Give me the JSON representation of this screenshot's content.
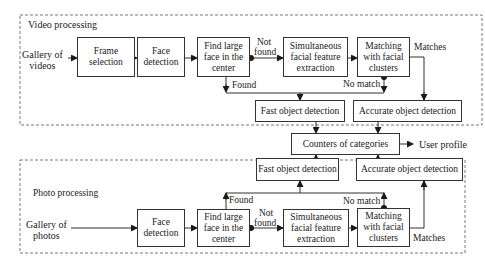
{
  "video_section": {
    "title": "Video processing",
    "input_label_line1": "Gallery of",
    "input_label_line2": "videos",
    "boxes": {
      "frame_selection": [
        "Frame",
        "selection"
      ],
      "face_detection": [
        "Face",
        "detection"
      ],
      "find_large_face": [
        "Find large",
        "face in the",
        "center"
      ],
      "feature_extraction": [
        "Simultaneous",
        "facial feature",
        "extraction"
      ],
      "matching": [
        "Matching",
        "with facial",
        "clusters"
      ],
      "fast_detection": "Fast object detection",
      "accurate_detection": "Accurate object detection"
    },
    "edge_labels": {
      "not_found_1": "Not",
      "not_found_2": "found",
      "found": "Found",
      "no_match": "No match",
      "matches": "Matches"
    }
  },
  "shared": {
    "counters": "Counters of categories",
    "output": "User profile"
  },
  "photo_section": {
    "title": "Photo processing",
    "input_label_line1": "Gallery of",
    "input_label_line2": "photos",
    "boxes": {
      "face_detection": [
        "Face",
        "detection"
      ],
      "find_large_face": [
        "Find large",
        "face in the",
        "center"
      ],
      "feature_extraction": [
        "Simultaneous",
        "facial feature",
        "extraction"
      ],
      "matching": [
        "Matching",
        "with facial",
        "clusters"
      ],
      "fast_detection": "Fast object detection",
      "accurate_detection": "Accurate object detection"
    },
    "edge_labels": {
      "not_found_1": "Not",
      "not_found_2": "found",
      "found": "Found",
      "no_match": "No match",
      "matches": "Matches"
    }
  }
}
